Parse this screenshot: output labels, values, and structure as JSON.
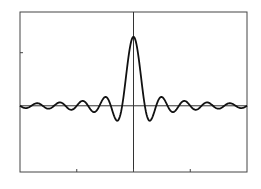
{
  "chart_data": {
    "type": "line",
    "title": "",
    "xlabel": "",
    "ylabel": "",
    "function": "sin(pi*x)/(pi*x)",
    "xlim": [
      -10,
      10
    ],
    "ylim": [
      -0.96,
      1.36
    ],
    "xticks": [
      -5,
      0,
      5
    ],
    "xtick_labels": [],
    "yticks": [
      0.77
    ],
    "ytick_labels": [],
    "grid": false,
    "legend": null,
    "axes_through_origin": true,
    "series": [
      {
        "name": "sinc",
        "color": "#111111",
        "sample_step": 0.05,
        "key_points": [
          {
            "x": -10,
            "y": 0.0
          },
          {
            "x": -2.46,
            "y": 0.128
          },
          {
            "x": -2,
            "y": 0.0
          },
          {
            "x": -1.43,
            "y": -0.217
          },
          {
            "x": -1,
            "y": 0.0
          },
          {
            "x": 0,
            "y": 1.0
          },
          {
            "x": 1,
            "y": 0.0
          },
          {
            "x": 1.43,
            "y": -0.217
          },
          {
            "x": 2,
            "y": 0.0
          },
          {
            "x": 2.46,
            "y": 0.128
          },
          {
            "x": 10,
            "y": 0.0
          }
        ]
      }
    ]
  },
  "plot_area": {
    "left": 20,
    "top": 12,
    "right": 247,
    "bottom": 172
  },
  "colors": {
    "frame": "#444444",
    "axis": "#333333",
    "curve": "#111111",
    "background": "#ffffff"
  }
}
